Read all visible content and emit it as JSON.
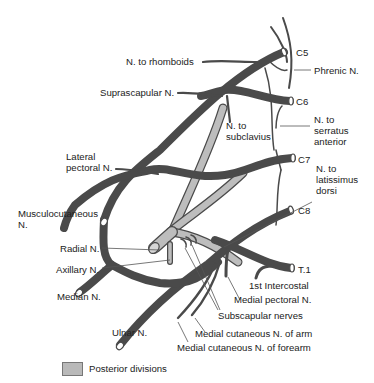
{
  "diagram": {
    "colors": {
      "nerve": "#4a4a4a",
      "posterior_division": "#bdbdbd",
      "leader_line": "#555555",
      "text": "#222222"
    },
    "roots": [
      "C5",
      "C6",
      "C7",
      "C8",
      "T.1"
    ],
    "labels": {
      "n_rhomboids": "N. to rhomboids",
      "phrenic": "Phrenic N.",
      "suprascapular": "Suprascapular N.",
      "n_subclavius_1": "N. to",
      "n_subclavius_2": "subclavius",
      "n_serratus_1": "N. to",
      "n_serratus_2": "serratus",
      "n_serratus_3": "anterior",
      "lateral_pectoral_1": "Lateral",
      "lateral_pectoral_2": "pectoral N.",
      "n_latissimus_1": "N. to",
      "n_latissimus_2": "latissimus",
      "n_latissimus_3": "dorsi",
      "musculocutaneous_1": "Musculocutaneous",
      "musculocutaneous_2": "N.",
      "radial": "Radial N.",
      "axillary": "Axillary N.",
      "median": "Median N.",
      "first_intercostal": "1st Intercostal",
      "medial_pectoral": "Medial pectoral N.",
      "subscapular": "Subscapular nerves",
      "ulnar": "Ulnar N.",
      "med_cut_arm": "Medial cutaneous N. of arm",
      "med_cut_forearm": "Medial cutaneous N. of forearm"
    },
    "legend": {
      "items": [
        {
          "label": "Posterior divisions",
          "color": "#b9b9b9"
        }
      ]
    }
  }
}
